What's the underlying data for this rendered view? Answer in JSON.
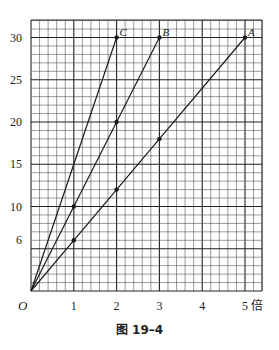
{
  "chart_data": {
    "type": "line",
    "title": "",
    "caption": "图 19–4",
    "xlabel": "倍",
    "ylabel": "",
    "origin_label": "O",
    "xlim": [
      0,
      5.4
    ],
    "ylim": [
      0,
      32
    ],
    "x_ticks": [
      1,
      2,
      3,
      4,
      5
    ],
    "x_tick_labels": [
      "1",
      "2",
      "3",
      "4",
      "5"
    ],
    "y_ticks": [
      6,
      10,
      15,
      20,
      25,
      30
    ],
    "y_tick_labels": [
      "6",
      "10",
      "15",
      "20",
      "25",
      "30"
    ],
    "grid": true,
    "grid_minor_x": 0.2,
    "grid_minor_y": 1,
    "grid_major_x": 1,
    "grid_major_y": 5,
    "legend": "none",
    "series": [
      {
        "name": "A",
        "x": [
          0,
          1,
          2,
          3,
          5
        ],
        "y": [
          0,
          6,
          12,
          18,
          30
        ],
        "marked": [
          [
            1,
            6
          ],
          [
            2,
            12
          ],
          [
            3,
            18
          ],
          [
            5,
            30
          ]
        ]
      },
      {
        "name": "B",
        "x": [
          0,
          1,
          2,
          3
        ],
        "y": [
          0,
          10,
          20,
          30
        ],
        "marked": [
          [
            1,
            10
          ],
          [
            2,
            20
          ],
          [
            3,
            30
          ]
        ]
      },
      {
        "name": "C",
        "x": [
          0,
          2
        ],
        "y": [
          0,
          30
        ],
        "marked": [
          [
            2,
            30
          ]
        ]
      }
    ]
  },
  "colors": {
    "line": "#1a1a1a",
    "grid_minor": "#555555",
    "grid_major": "#222222"
  }
}
